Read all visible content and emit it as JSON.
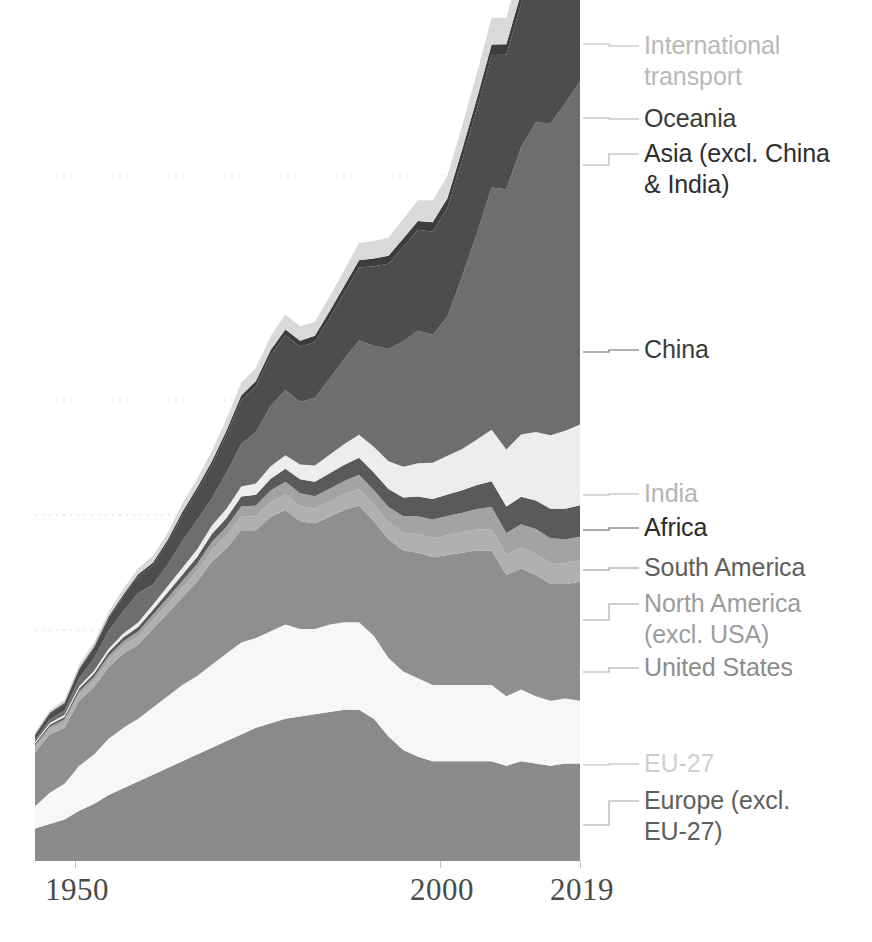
{
  "chart_data": {
    "type": "area",
    "stacked": true,
    "title": "",
    "subtitle": "",
    "xlabel": "",
    "ylabel": "",
    "grid": true,
    "gridlines_y": [
      176,
      400,
      515,
      630,
      745
    ],
    "legend_position": "right-outside-with-leader-lines",
    "xlim": [
      1945,
      2019
    ],
    "ylim": [
      0,
      37
    ],
    "x_tick_labels": [
      "1950",
      "2000",
      "2019"
    ],
    "x_tick_values": [
      1950,
      2000,
      2019
    ],
    "x": [
      1945,
      1947,
      1949,
      1951,
      1953,
      1955,
      1957,
      1959,
      1961,
      1963,
      1965,
      1967,
      1969,
      1971,
      1973,
      1975,
      1977,
      1979,
      1981,
      1983,
      1985,
      1987,
      1989,
      1991,
      1993,
      1995,
      1997,
      1999,
      2001,
      2003,
      2005,
      2007,
      2009,
      2011,
      2013,
      2015,
      2017,
      2019
    ],
    "series": [
      {
        "name": "Europe (excl. EU-27)",
        "color": "#8a8a8a",
        "values": [
          1.4,
          1.6,
          1.8,
          2.2,
          2.5,
          2.9,
          3.2,
          3.5,
          3.8,
          4.1,
          4.4,
          4.7,
          5.0,
          5.3,
          5.6,
          5.9,
          6.1,
          6.3,
          6.4,
          6.5,
          6.6,
          6.7,
          6.7,
          6.3,
          5.5,
          4.9,
          4.6,
          4.4,
          4.4,
          4.4,
          4.4,
          4.4,
          4.2,
          4.4,
          4.3,
          4.2,
          4.3,
          4.3
        ]
      },
      {
        "name": "EU-27",
        "color": "#f7f7f7",
        "values": [
          1.0,
          1.4,
          1.6,
          2.0,
          2.2,
          2.5,
          2.7,
          2.8,
          3.0,
          3.2,
          3.4,
          3.5,
          3.7,
          3.9,
          4.1,
          4.0,
          4.1,
          4.2,
          3.9,
          3.8,
          3.9,
          3.9,
          3.9,
          3.7,
          3.5,
          3.5,
          3.5,
          3.4,
          3.4,
          3.4,
          3.4,
          3.4,
          3.1,
          3.2,
          3.0,
          2.9,
          2.9,
          2.8
        ]
      },
      {
        "name": "United States",
        "color": "#8f8f8f",
        "values": [
          2.4,
          2.6,
          2.5,
          2.9,
          3.0,
          3.2,
          3.3,
          3.3,
          3.5,
          3.7,
          3.9,
          4.2,
          4.6,
          4.7,
          5.0,
          4.8,
          5.1,
          5.1,
          4.8,
          4.7,
          4.8,
          5.0,
          5.2,
          5.1,
          5.3,
          5.4,
          5.6,
          5.7,
          5.8,
          5.9,
          6.0,
          6.0,
          5.4,
          5.4,
          5.4,
          5.2,
          5.1,
          5.3
        ]
      },
      {
        "name": "North America (excl. USA)",
        "color": "#b0b0b0",
        "values": [
          0.2,
          0.22,
          0.24,
          0.27,
          0.29,
          0.32,
          0.34,
          0.36,
          0.38,
          0.41,
          0.44,
          0.47,
          0.51,
          0.55,
          0.6,
          0.62,
          0.65,
          0.69,
          0.68,
          0.66,
          0.68,
          0.7,
          0.74,
          0.74,
          0.76,
          0.79,
          0.83,
          0.85,
          0.88,
          0.91,
          0.93,
          0.96,
          0.9,
          0.93,
          0.95,
          0.94,
          0.93,
          0.94
        ]
      },
      {
        "name": "South America",
        "color": "#a3a3a3",
        "values": [
          0.1,
          0.12,
          0.13,
          0.15,
          0.17,
          0.19,
          0.21,
          0.23,
          0.25,
          0.27,
          0.3,
          0.33,
          0.37,
          0.41,
          0.46,
          0.48,
          0.52,
          0.57,
          0.57,
          0.55,
          0.57,
          0.6,
          0.63,
          0.65,
          0.68,
          0.73,
          0.79,
          0.83,
          0.86,
          0.87,
          0.92,
          0.98,
          0.98,
          1.04,
          1.1,
          1.1,
          1.07,
          1.07
        ]
      },
      {
        "name": "Africa",
        "color": "#5a5a5a",
        "values": [
          0.08,
          0.09,
          0.1,
          0.12,
          0.14,
          0.16,
          0.18,
          0.2,
          0.22,
          0.25,
          0.28,
          0.31,
          0.35,
          0.39,
          0.44,
          0.48,
          0.53,
          0.58,
          0.62,
          0.65,
          0.69,
          0.72,
          0.76,
          0.78,
          0.8,
          0.84,
          0.88,
          0.91,
          0.95,
          1.0,
          1.07,
          1.14,
          1.18,
          1.22,
          1.28,
          1.32,
          1.36,
          1.4
        ]
      },
      {
        "name": "India",
        "color": "#ededed",
        "values": [
          0.07,
          0.08,
          0.09,
          0.11,
          0.13,
          0.15,
          0.17,
          0.2,
          0.23,
          0.27,
          0.3,
          0.33,
          0.37,
          0.41,
          0.45,
          0.5,
          0.55,
          0.6,
          0.66,
          0.73,
          0.82,
          0.92,
          1.03,
          1.15,
          1.24,
          1.37,
          1.49,
          1.62,
          1.73,
          1.84,
          2.02,
          2.3,
          2.54,
          2.78,
          3.05,
          3.28,
          3.48,
          3.6
        ]
      },
      {
        "name": "China",
        "color": "#6e6e6e",
        "values": [
          0.1,
          0.15,
          0.2,
          0.35,
          0.55,
          0.8,
          1.0,
          1.3,
          0.9,
          0.95,
          1.2,
          1.3,
          1.2,
          1.6,
          1.9,
          2.3,
          2.7,
          2.9,
          2.8,
          3.0,
          3.4,
          3.8,
          4.2,
          4.5,
          5.0,
          5.6,
          5.9,
          5.7,
          6.2,
          7.7,
          9.2,
          10.8,
          11.6,
          12.8,
          13.8,
          13.9,
          14.6,
          15.3
        ]
      },
      {
        "name": "Asia (excl. China & India)",
        "color": "#4d4d4d",
        "values": [
          0.2,
          0.25,
          0.3,
          0.38,
          0.46,
          0.55,
          0.65,
          0.75,
          0.86,
          0.99,
          1.15,
          1.3,
          1.5,
          1.7,
          1.95,
          2.05,
          2.25,
          2.45,
          2.45,
          2.5,
          2.7,
          2.95,
          3.25,
          3.55,
          3.8,
          4.2,
          4.5,
          4.6,
          4.85,
          5.2,
          5.55,
          5.9,
          6.0,
          6.4,
          6.65,
          6.75,
          6.9,
          7.05
        ]
      },
      {
        "name": "Oceania",
        "color": "#3c3c3c",
        "values": [
          0.04,
          0.05,
          0.05,
          0.06,
          0.07,
          0.08,
          0.09,
          0.1,
          0.11,
          0.12,
          0.14,
          0.15,
          0.17,
          0.19,
          0.21,
          0.22,
          0.24,
          0.26,
          0.27,
          0.28,
          0.3,
          0.31,
          0.33,
          0.34,
          0.36,
          0.38,
          0.4,
          0.42,
          0.43,
          0.45,
          0.46,
          0.47,
          0.47,
          0.48,
          0.48,
          0.48,
          0.49,
          0.5
        ]
      },
      {
        "name": "International transport",
        "color": "#d9d9d9",
        "values": [
          0.1,
          0.12,
          0.14,
          0.17,
          0.19,
          0.22,
          0.25,
          0.27,
          0.3,
          0.33,
          0.37,
          0.41,
          0.46,
          0.51,
          0.57,
          0.58,
          0.62,
          0.67,
          0.64,
          0.62,
          0.65,
          0.7,
          0.76,
          0.78,
          0.8,
          0.86,
          0.92,
          0.97,
          1.0,
          1.05,
          1.12,
          1.2,
          1.18,
          1.24,
          1.28,
          1.3,
          1.34,
          1.38
        ]
      }
    ]
  },
  "legend": {
    "items": [
      {
        "label": "International\ntransport",
        "color": "#b9b9b9",
        "leader_color": "#d0d0d0"
      },
      {
        "label": "Oceania",
        "color": "#3b3b3b",
        "leader_color": "#c9c9c9"
      },
      {
        "label": "Asia (excl. China\n& India)",
        "color": "#2e2e2e",
        "leader_color": "#c9c9c9"
      },
      {
        "label": "China",
        "color": "#3b3b3b",
        "leader_color": "#9a9a9a"
      },
      {
        "label": "India",
        "color": "#b5b5b5",
        "leader_color": "#cccccc"
      },
      {
        "label": "Africa",
        "color": "#2b2b2b",
        "leader_color": "#8f8f8f"
      },
      {
        "label": "South America",
        "color": "#5e5e5e",
        "leader_color": "#b5b5b5"
      },
      {
        "label": "North America\n(excl. USA)",
        "color": "#9c9c9c",
        "leader_color": "#c2c2c2"
      },
      {
        "label": "United States",
        "color": "#8c8c8c",
        "leader_color": "#c2c2c2"
      },
      {
        "label": "EU-27",
        "color": "#cfcfcf",
        "leader_color": "#cfcfcf"
      },
      {
        "label": "Europe (excl.\nEU-27)",
        "color": "#5e5e5e",
        "leader_color": "#c2c2c2"
      }
    ]
  },
  "axis": {
    "ticks": [
      {
        "label": "1950",
        "x": 75
      },
      {
        "label": "2000",
        "x": 440
      },
      {
        "label": "2019",
        "x": 580
      }
    ]
  },
  "colors": {
    "background": "#ffffff",
    "axis_line": "#8c8c8c",
    "gridline": "#e8e8e8",
    "tick_text": "#4a4a4a"
  }
}
